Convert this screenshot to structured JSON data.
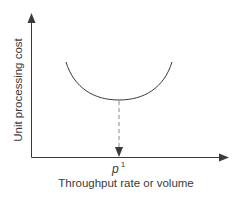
{
  "diagram": {
    "type": "u-shaped cost curve",
    "y_axis_label": "Unit processing cost",
    "x_axis_label": "Throughput rate or volume",
    "optimum_marker": {
      "symbol": "p",
      "superscript": "1"
    },
    "colors": {
      "axis": "#3a3a3a",
      "curve": "#3a3a3a",
      "dashed_line": "#8a8a8a",
      "text": "#3a3a3a",
      "background": "#ffffff"
    }
  }
}
